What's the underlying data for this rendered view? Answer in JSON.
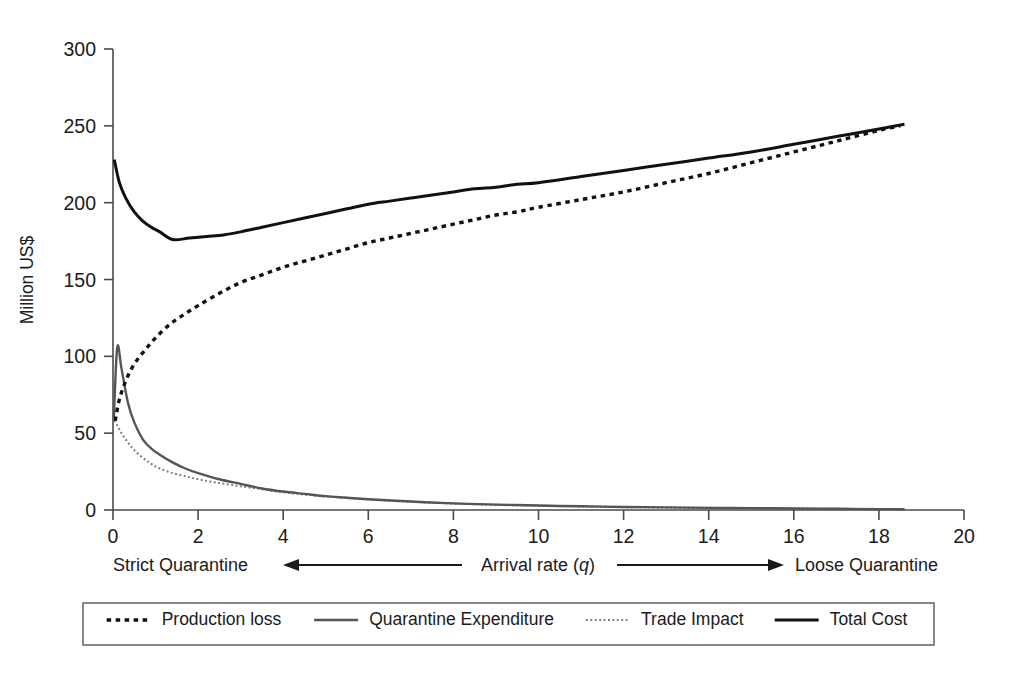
{
  "figure": {
    "background_color": "#ffffff",
    "ylabel": "Million US$",
    "xlabel_center": "Arrival rate (q)",
    "xlabel_center_plain": "Arrival rate (",
    "xlabel_center_italic": "q",
    "xlabel_center_close": ")",
    "annotation_left": "Strict Quarantine",
    "annotation_right": "Loose Quarantine"
  },
  "axes": {
    "y_ticks": [
      "0",
      "50",
      "100",
      "150",
      "200",
      "250",
      "300"
    ],
    "x_ticks": [
      "0",
      "2",
      "4",
      "6",
      "8",
      "10",
      "12",
      "14",
      "16",
      "18",
      "20"
    ]
  },
  "legend": {
    "items": [
      {
        "label": "Production loss",
        "style": "dashed-bold",
        "color": "#111111"
      },
      {
        "label": "Quarantine Expenditure",
        "style": "solid-gray",
        "color": "#555555"
      },
      {
        "label": "Trade Impact",
        "style": "dotted-fine",
        "color": "#777777"
      },
      {
        "label": "Total Cost",
        "style": "solid-black",
        "color": "#111111"
      }
    ]
  },
  "chart_data": {
    "type": "line",
    "title": "",
    "xlabel": "Arrival rate (q)",
    "ylabel": "Million US$",
    "xlim": [
      0,
      20
    ],
    "ylim": [
      0,
      300
    ],
    "xticks": [
      0,
      2,
      4,
      6,
      8,
      10,
      12,
      14,
      16,
      18,
      20
    ],
    "yticks": [
      0,
      50,
      100,
      150,
      200,
      250,
      300
    ],
    "grid": false,
    "legend_position": "bottom-outside",
    "annotations": [
      {
        "text": "Strict Quarantine",
        "position": "below-axis-left"
      },
      {
        "text": "Arrival rate (q)",
        "position": "below-axis-center"
      },
      {
        "text": "Loose Quarantine",
        "position": "below-axis-right"
      }
    ],
    "series": [
      {
        "name": "Production loss",
        "style": "dashed",
        "color": "#111111",
        "x": [
          0.05,
          0.15,
          0.3,
          0.5,
          0.75,
          1.0,
          1.3,
          1.6,
          2.0,
          2.5,
          3.0,
          3.5,
          4.0,
          4.5,
          5.0,
          5.5,
          6.0,
          6.5,
          7.0,
          7.5,
          8.0,
          8.5,
          9.0,
          9.5,
          10.0,
          11.0,
          12.0,
          13.0,
          14.0,
          15.0,
          16.0,
          17.0,
          18.0,
          18.5
        ],
        "y": [
          58,
          72,
          84,
          95,
          104,
          112,
          120,
          126,
          133,
          141,
          148,
          153,
          158,
          162,
          166,
          170,
          174,
          177,
          180,
          183,
          186,
          189,
          192,
          194,
          197,
          202,
          207,
          213,
          219,
          226,
          233,
          240,
          247,
          250
        ]
      },
      {
        "name": "Quarantine Expenditure",
        "style": "solid",
        "color": "#555555",
        "x": [
          0.02,
          0.1,
          0.2,
          0.35,
          0.5,
          0.7,
          0.9,
          1.1,
          1.4,
          1.7,
          2.0,
          2.5,
          3.0,
          3.5,
          4.0,
          4.5,
          5.0,
          5.5,
          6.0,
          7.0,
          8.0,
          9.0,
          10.0,
          11.0,
          12.0,
          13.0,
          14.0,
          15.0,
          16.0,
          17.0,
          18.0,
          18.6
        ],
        "y": [
          60,
          106,
          92,
          70,
          57,
          46,
          40,
          36,
          31,
          27,
          24,
          20,
          17,
          14,
          12,
          10.5,
          9,
          8,
          7,
          5.5,
          4.3,
          3.5,
          2.9,
          2.4,
          2.0,
          1.7,
          1.4,
          1.2,
          1.0,
          0.8,
          0.6,
          0.5
        ]
      },
      {
        "name": "Trade Impact",
        "style": "dotted",
        "color": "#777777",
        "x": [
          0.02,
          0.1,
          0.2,
          0.35,
          0.5,
          0.7,
          0.9,
          1.1,
          1.4,
          1.7,
          2.0,
          2.5,
          3.0,
          3.5,
          4.0,
          4.5,
          5.0,
          5.5,
          6.0,
          7.0,
          8.0,
          9.0,
          10.0,
          11.0,
          12.0,
          13.0,
          14.0,
          15.0,
          16.0,
          17.0,
          18.0,
          18.6
        ],
        "y": [
          58,
          55,
          50,
          44,
          39,
          34,
          30,
          27,
          24,
          22,
          20,
          17.5,
          15.5,
          13.5,
          11.5,
          10,
          8.8,
          7.8,
          6.9,
          5.4,
          4.2,
          3.4,
          2.8,
          2.3,
          1.9,
          1.6,
          1.4,
          1.2,
          1.0,
          0.8,
          0.6,
          0.5
        ]
      },
      {
        "name": "Total Cost",
        "style": "solid",
        "color": "#111111",
        "x": [
          0.03,
          0.15,
          0.3,
          0.5,
          0.7,
          0.9,
          1.1,
          1.4,
          1.8,
          2.2,
          2.6,
          3.0,
          3.5,
          4.0,
          4.5,
          5.0,
          5.5,
          6.0,
          6.5,
          7.0,
          7.5,
          8.0,
          8.5,
          9.0,
          9.5,
          10.0,
          11.0,
          12.0,
          13.0,
          14.0,
          15.0,
          16.0,
          17.0,
          18.0,
          18.6
        ],
        "y": [
          228,
          213,
          203,
          194,
          188,
          184,
          181,
          176,
          177,
          178,
          179,
          181,
          184,
          187,
          190,
          193,
          196,
          199,
          201,
          203,
          205,
          207,
          209,
          210,
          212,
          213,
          217,
          221,
          225,
          229,
          233,
          238,
          243,
          248,
          251
        ]
      }
    ]
  }
}
